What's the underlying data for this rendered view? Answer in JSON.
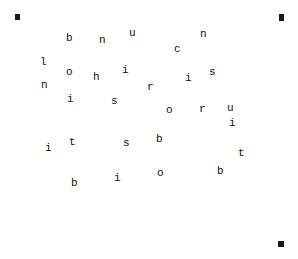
{
  "page": {
    "kind": "letter-scatter-puzzle",
    "background_color": "#ffffff",
    "ink_color": "#101010",
    "width": 298,
    "height": 259
  },
  "frame": {
    "name": "hand-drawn-rectangle-border",
    "color": "#1a1a1a",
    "left": 16,
    "top": 15,
    "width": 267,
    "height": 230,
    "stroke": 3
  },
  "letters": [
    {
      "char": "b",
      "x": 66,
      "y": 33,
      "size": 11
    },
    {
      "char": "n",
      "x": 99,
      "y": 35,
      "size": 11
    },
    {
      "char": "u",
      "x": 129,
      "y": 28,
      "size": 11
    },
    {
      "char": "n",
      "x": 200,
      "y": 29,
      "size": 11
    },
    {
      "char": "c",
      "x": 174,
      "y": 44,
      "size": 11
    },
    {
      "char": "l",
      "x": 40,
      "y": 57,
      "size": 11
    },
    {
      "char": "o",
      "x": 66,
      "y": 67,
      "size": 11
    },
    {
      "char": "i",
      "x": 122,
      "y": 65,
      "size": 11
    },
    {
      "char": "h",
      "x": 93,
      "y": 72,
      "size": 11
    },
    {
      "char": "i",
      "x": 185,
      "y": 73,
      "size": 11
    },
    {
      "char": "s",
      "x": 209,
      "y": 67,
      "size": 11
    },
    {
      "char": "n",
      "x": 41,
      "y": 80,
      "size": 11
    },
    {
      "char": "r",
      "x": 147,
      "y": 82,
      "size": 11
    },
    {
      "char": "i",
      "x": 67,
      "y": 94,
      "size": 11
    },
    {
      "char": "s",
      "x": 111,
      "y": 96,
      "size": 11
    },
    {
      "char": "o",
      "x": 166,
      "y": 105,
      "size": 11
    },
    {
      "char": "r",
      "x": 199,
      "y": 104,
      "size": 11
    },
    {
      "char": "u",
      "x": 227,
      "y": 103,
      "size": 11
    },
    {
      "char": "i",
      "x": 229,
      "y": 118,
      "size": 11
    },
    {
      "char": "i",
      "x": 45,
      "y": 143,
      "size": 11
    },
    {
      "char": "t",
      "x": 69,
      "y": 137,
      "size": 11
    },
    {
      "char": "s",
      "x": 123,
      "y": 138,
      "size": 11
    },
    {
      "char": "b",
      "x": 156,
      "y": 134,
      "size": 11
    },
    {
      "char": "t",
      "x": 238,
      "y": 148,
      "size": 11
    },
    {
      "char": "o",
      "x": 157,
      "y": 168,
      "size": 11
    },
    {
      "char": "b",
      "x": 217,
      "y": 166,
      "size": 11
    },
    {
      "char": "i",
      "x": 114,
      "y": 173,
      "size": 11
    },
    {
      "char": "b",
      "x": 71,
      "y": 178,
      "size": 11
    }
  ]
}
